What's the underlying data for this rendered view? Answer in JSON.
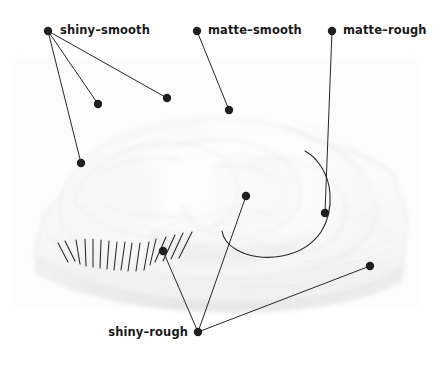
{
  "figure": {
    "width": 440,
    "height": 368,
    "background_color": "#ffffff",
    "ink_color": "#262626",
    "dot_color": "#1f1f1f",
    "photo_description": "faded grayscale photograph of a shrink-wrapped food tray"
  },
  "labels": [
    {
      "id": "shiny-smooth",
      "text": "shiny–smooth",
      "text_x": 60,
      "text_y": 25,
      "anchor_x": 48,
      "anchor_y": 31,
      "anchor_align": "left",
      "targets": [
        {
          "x": 98,
          "y": 104
        },
        {
          "x": 167,
          "y": 98
        },
        {
          "x": 81,
          "y": 163
        }
      ]
    },
    {
      "id": "matte-smooth",
      "text": "matte–smooth",
      "text_x": 208,
      "text_y": 25,
      "anchor_x": 197,
      "anchor_y": 31,
      "anchor_align": "left",
      "targets": [
        {
          "x": 229,
          "y": 110
        }
      ]
    },
    {
      "id": "matte-rough",
      "text": "matte–rough",
      "text_x": 343,
      "text_y": 25,
      "anchor_x": 332,
      "anchor_y": 31,
      "anchor_align": "left",
      "targets": [
        {
          "x": 325,
          "y": 213
        }
      ]
    },
    {
      "id": "shiny-rough",
      "text": "shiny–rough",
      "text_x": 188,
      "text_y": 327,
      "anchor_x": 198,
      "anchor_y": 332,
      "anchor_align": "right",
      "targets": [
        {
          "x": 163,
          "y": 251
        },
        {
          "x": 246,
          "y": 196
        },
        {
          "x": 370,
          "y": 266
        }
      ]
    }
  ],
  "freehand_outline": {
    "id": "matte-rough-region-outline",
    "path": "M 305 151 C 318 158 329 175 330 194 C 331 209 328 221 321 232 C 312 245 298 253 282 256 C 266 259 249 257 237 250 C 228 245 223 238 222 231"
  },
  "hatch_marks": {
    "id": "shiny-rough-hatching",
    "count": 17,
    "strokes": [
      {
        "x1": 58,
        "y1": 243,
        "x2": 68,
        "y2": 262
      },
      {
        "x1": 65,
        "y1": 241,
        "x2": 75,
        "y2": 261
      },
      {
        "x1": 76,
        "y1": 240,
        "x2": 80,
        "y2": 264
      },
      {
        "x1": 85,
        "y1": 239,
        "x2": 86,
        "y2": 266
      },
      {
        "x1": 93,
        "y1": 239,
        "x2": 93,
        "y2": 267
      },
      {
        "x1": 101,
        "y1": 240,
        "x2": 100,
        "y2": 268
      },
      {
        "x1": 109,
        "y1": 241,
        "x2": 107,
        "y2": 269
      },
      {
        "x1": 117,
        "y1": 242,
        "x2": 114,
        "y2": 270
      },
      {
        "x1": 125,
        "y1": 242,
        "x2": 121,
        "y2": 270
      },
      {
        "x1": 132,
        "y1": 243,
        "x2": 128,
        "y2": 271
      },
      {
        "x1": 140,
        "y1": 243,
        "x2": 136,
        "y2": 271
      },
      {
        "x1": 149,
        "y1": 242,
        "x2": 144,
        "y2": 270
      },
      {
        "x1": 156,
        "y1": 239,
        "x2": 150,
        "y2": 265
      },
      {
        "x1": 166,
        "y1": 237,
        "x2": 155,
        "y2": 262
      },
      {
        "x1": 175,
        "y1": 235,
        "x2": 163,
        "y2": 261
      },
      {
        "x1": 183,
        "y1": 233,
        "x2": 171,
        "y2": 259
      },
      {
        "x1": 192,
        "y1": 232,
        "x2": 179,
        "y2": 258
      }
    ]
  }
}
